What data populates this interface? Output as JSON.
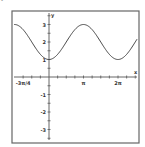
{
  "figure": {
    "marker": "•"
  },
  "chart_data": {
    "type": "line",
    "title": "",
    "function": "y = 2 - cos(x)",
    "xlabel": "x",
    "ylabel": "y",
    "xlim_pi": [
      -1.072,
      2.609
    ],
    "ylim": [
      -3.77,
      3.77
    ],
    "grid": false,
    "legend": null,
    "x_tick_labels": [
      {
        "value_pi": -0.75,
        "label": "-3π/4"
      },
      {
        "value_pi": 1,
        "label": "π"
      },
      {
        "value_pi": 2,
        "label": "2π"
      }
    ],
    "x_minor_tick_step_pi": 0.25,
    "y_tick_labels": [
      {
        "value": 3,
        "label": "3"
      },
      {
        "value": 2,
        "label": "2"
      },
      {
        "value": 1,
        "label": "1"
      },
      {
        "value": -1,
        "label": "-1"
      },
      {
        "value": -2,
        "label": "-2"
      },
      {
        "value": -3,
        "label": "-3"
      }
    ],
    "y_minor_tick_step": 0.5,
    "series": [
      {
        "name": "2 - cos(x)",
        "color": "#444444",
        "points": [
          {
            "x_pi": -1.0,
            "y": 3.0
          },
          {
            "x_pi": -0.75,
            "y": 2.71
          },
          {
            "x_pi": -0.5,
            "y": 2.0
          },
          {
            "x_pi": -0.25,
            "y": 1.29
          },
          {
            "x_pi": 0,
            "y": 1.0
          },
          {
            "x_pi": 0.25,
            "y": 1.29
          },
          {
            "x_pi": 0.5,
            "y": 2.0
          },
          {
            "x_pi": 0.75,
            "y": 2.71
          },
          {
            "x_pi": 1.0,
            "y": 3.0
          },
          {
            "x_pi": 1.25,
            "y": 2.71
          },
          {
            "x_pi": 1.5,
            "y": 2.0
          },
          {
            "x_pi": 1.75,
            "y": 1.29
          },
          {
            "x_pi": 2.0,
            "y": 1.0
          },
          {
            "x_pi": 2.25,
            "y": 1.29
          },
          {
            "x_pi": 2.5,
            "y": 2.0
          }
        ]
      }
    ]
  },
  "layout": {
    "frame": {
      "x": 12,
      "y": 11,
      "w": 127,
      "h": 132
    },
    "origin_px": {
      "x": 49,
      "y": 77
    },
    "px_per_pi": 34.5,
    "px_per_unit_y": 17.5,
    "axis_color": "#555555",
    "frame_color": "#666666"
  }
}
